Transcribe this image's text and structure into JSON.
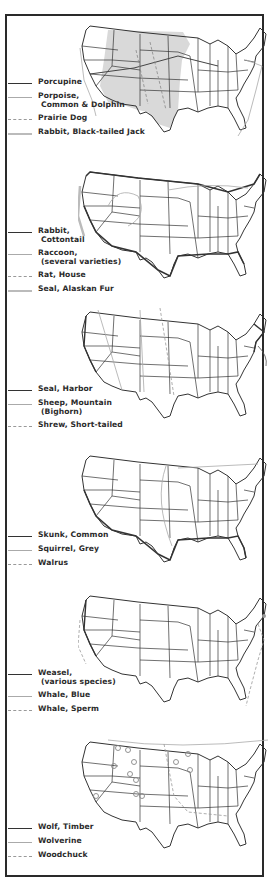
{
  "page": {
    "type": "scanned-document"
  },
  "panels": [
    {
      "legend": [
        {
          "label": "Porcupine",
          "style": "solid"
        },
        {
          "label": "Porpoise,",
          "sub": "Common & Dolphin",
          "style": "light"
        },
        {
          "label": "Prairie Dog",
          "style": "dash"
        },
        {
          "label": "Rabbit, Black-tailed Jack",
          "style": "thick"
        }
      ]
    },
    {
      "legend": [
        {
          "label": "Rabbit,",
          "sub": "Cottontail",
          "style": "solid"
        },
        {
          "label": "Raccoon,",
          "sub": "(several varieties)",
          "style": "light"
        },
        {
          "label": "Rat, House",
          "style": "dash"
        },
        {
          "label": "Seal, Alaskan Fur",
          "style": "thick"
        }
      ]
    },
    {
      "legend": [
        {
          "label": "Seal, Harbor",
          "style": "solid"
        },
        {
          "label": "Sheep, Mountain",
          "sub": "(Bighorn)",
          "style": "light"
        },
        {
          "label": "Shrew, Short-tailed",
          "style": "dash"
        }
      ]
    },
    {
      "legend": [
        {
          "label": "Skunk, Common",
          "style": "solid"
        },
        {
          "label": "Squirrel, Grey",
          "style": "light"
        },
        {
          "label": "Walrus",
          "style": "dash"
        }
      ]
    },
    {
      "legend": [
        {
          "label": "Weasel,",
          "sub": "(various species)",
          "style": "solid"
        },
        {
          "label": "Whale, Blue",
          "style": "light"
        },
        {
          "label": "Whale, Sperm",
          "style": "dash"
        }
      ]
    },
    {
      "legend": [
        {
          "label": "Wolf, Timber",
          "style": "solid"
        },
        {
          "label": "Wolverine",
          "style": "light"
        },
        {
          "label": "Woodchuck",
          "style": "dash"
        }
      ]
    }
  ],
  "colors": {
    "ink": "#2b2b2b",
    "range_fill": "#d9d9d9",
    "frame": "#2a2a2a",
    "background": "#ffffff"
  }
}
